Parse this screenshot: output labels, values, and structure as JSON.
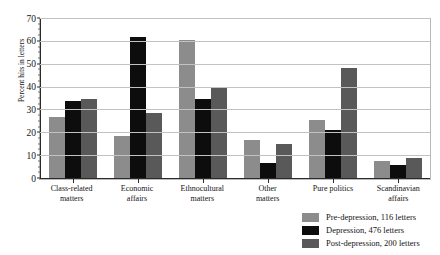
{
  "figure": {
    "title_remnant": "",
    "ylabel": "Percent hits in letters"
  },
  "legend": {
    "items": [
      {
        "key": "pre",
        "label": "Pre-depression, 116 letters",
        "color": "#8c8c8c"
      },
      {
        "key": "dep",
        "label": "Depression, 476 letters",
        "color": "#0d0d0d"
      },
      {
        "key": "post",
        "label": "Post-depression, 200 letters",
        "color": "#595959"
      }
    ]
  },
  "chart_data": {
    "type": "bar",
    "title": "",
    "xlabel": "",
    "ylabel": "Percent hits in letters",
    "ylim": [
      0,
      70
    ],
    "yticks": [
      0,
      10,
      20,
      30,
      40,
      50,
      60,
      70
    ],
    "grid": true,
    "legend_position": "bottom-right",
    "categories": [
      "Class-related matters",
      "Economic affairs",
      "Ethnocultural matters",
      "Other matters",
      "Pure politics",
      "Scandinavian affairs"
    ],
    "category_lines": [
      [
        "Class-related",
        "matters"
      ],
      [
        "Economic",
        "affairs"
      ],
      [
        "Ethnocultural",
        "matters"
      ],
      [
        "Other",
        "matters"
      ],
      [
        "Pure politics",
        ""
      ],
      [
        "Scandinavian",
        "affairs"
      ]
    ],
    "series": [
      {
        "name": "Pre-depression, 116 letters",
        "key": "pre",
        "color": "#8c8c8c",
        "values": [
          27,
          19,
          61,
          17,
          26,
          8
        ]
      },
      {
        "name": "Depression, 476 letters",
        "key": "dep",
        "color": "#0d0d0d",
        "values": [
          34,
          62,
          35,
          7,
          21.5,
          6
        ]
      },
      {
        "name": "Post-depression, 200 letters",
        "key": "post",
        "color": "#595959",
        "values": [
          35,
          29,
          40,
          15.5,
          48.5,
          9
        ]
      }
    ]
  }
}
